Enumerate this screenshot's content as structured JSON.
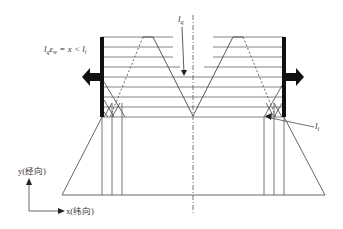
{
  "labels": {
    "top_left_formula_l": "l",
    "top_left_formula_sub_q": "q",
    "top_left_formula_eps": "ε",
    "top_left_formula_sub_w": "w",
    "top_left_formula_rest": " = x < l",
    "top_left_formula_sub_i": "i",
    "center_arrow_label": "l",
    "center_arrow_sub": "q",
    "right_arrow_label": "l",
    "right_arrow_sub": "i",
    "axis_y_label": "y(经向)",
    "axis_x_label": "x(纬向)"
  },
  "colors": {
    "line": "#555555",
    "thick": "#111111",
    "text": "#333333"
  }
}
